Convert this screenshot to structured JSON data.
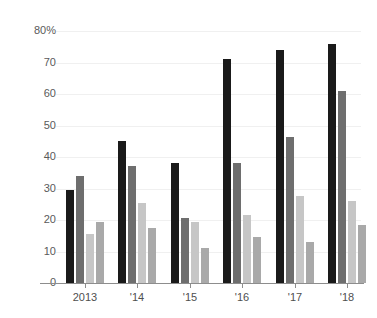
{
  "chart_data": {
    "type": "bar",
    "title": "",
    "subtitle": "",
    "xlabel": "",
    "ylabel": "",
    "ylim": [
      0,
      80
    ],
    "grid": true,
    "legend": "none",
    "categories": [
      "2013",
      "'14",
      "'15",
      "'16",
      "'17",
      "'18"
    ],
    "ytick_labels": [
      "80%",
      "70",
      "60",
      "50",
      "40",
      "30",
      "20",
      "10",
      "0"
    ],
    "ytick_values": [
      80,
      70,
      60,
      50,
      40,
      30,
      20,
      10,
      0
    ],
    "series": [
      {
        "name": "series-1",
        "color": "#1a1a1a",
        "values": [
          29.5,
          45,
          38,
          71,
          74,
          76
        ]
      },
      {
        "name": "series-2",
        "color": "#6e6e6e",
        "values": [
          34,
          37,
          20.5,
          38,
          46.5,
          61
        ]
      },
      {
        "name": "series-3",
        "color": "#c6c6c6",
        "values": [
          15.5,
          25.5,
          19.5,
          21.5,
          27.5,
          26
        ]
      },
      {
        "name": "series-4",
        "color": "#a9a9a9",
        "values": [
          19.5,
          17.5,
          11,
          14.5,
          13,
          18.5
        ]
      }
    ]
  },
  "colors": {
    "background": "#ffffff",
    "gridline": "#f0f0f0",
    "axis_line": "#8d8d8d",
    "tick_text": "#5a5a5a"
  }
}
